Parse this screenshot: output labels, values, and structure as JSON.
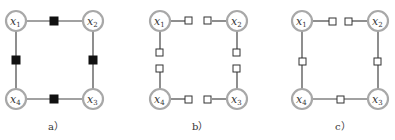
{
  "figure": {
    "panels": [
      {
        "caption": "a）",
        "style": "filled-factors",
        "nodes": [
          {
            "id": "x1",
            "var": "x",
            "sub": "1"
          },
          {
            "id": "x2",
            "var": "x",
            "sub": "2"
          },
          {
            "id": "x3",
            "var": "x",
            "sub": "3"
          },
          {
            "id": "x4",
            "var": "x",
            "sub": "4"
          }
        ],
        "factors": [
          "x1-x2",
          "x2-x3",
          "x3-x4",
          "x4-x1"
        ]
      },
      {
        "caption": "b）",
        "style": "split-empty-factors",
        "nodes": [
          {
            "id": "x1",
            "var": "x",
            "sub": "1"
          },
          {
            "id": "x2",
            "var": "x",
            "sub": "2"
          },
          {
            "id": "x3",
            "var": "x",
            "sub": "3"
          },
          {
            "id": "x4",
            "var": "x",
            "sub": "4"
          }
        ],
        "factors": [
          "x1",
          "x2",
          "x2",
          "x3",
          "x3",
          "x4",
          "x4",
          "x1"
        ]
      },
      {
        "caption": "c）",
        "style": "mixed-empty-factors",
        "nodes": [
          {
            "id": "x1",
            "var": "x",
            "sub": "1"
          },
          {
            "id": "x2",
            "var": "x",
            "sub": "2"
          },
          {
            "id": "x3",
            "var": "x",
            "sub": "3"
          },
          {
            "id": "x4",
            "var": "x",
            "sub": "4"
          }
        ],
        "factors": [
          "x1",
          "x2",
          "x2-x3",
          "x3-x4",
          "x4-x1"
        ]
      }
    ]
  }
}
